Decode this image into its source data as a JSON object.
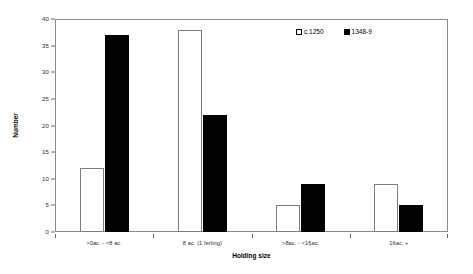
{
  "chart_data": {
    "type": "bar",
    "title": "",
    "xlabel": "Holding size",
    "ylabel": "Number",
    "categories": [
      ">0ac. - <8 ac.",
      "8 ac. (1 ferling)",
      ">8ac. - <16ac.",
      "16ac. +"
    ],
    "series": [
      {
        "name": "c.1250",
        "values": [
          12,
          38,
          5,
          9
        ],
        "color": "#ffffff"
      },
      {
        "name": "1348-9",
        "values": [
          37,
          22,
          9,
          5
        ],
        "color": "#000000"
      }
    ],
    "ylim": [
      0,
      40
    ],
    "ytick_values": [
      0,
      5,
      10,
      15,
      20,
      25,
      30,
      35,
      40
    ],
    "ytick_labels": [
      "0",
      "5",
      "10",
      "15",
      "20",
      "25",
      "30",
      "35",
      "40"
    ],
    "grid": false,
    "legend_position": "top-right"
  }
}
